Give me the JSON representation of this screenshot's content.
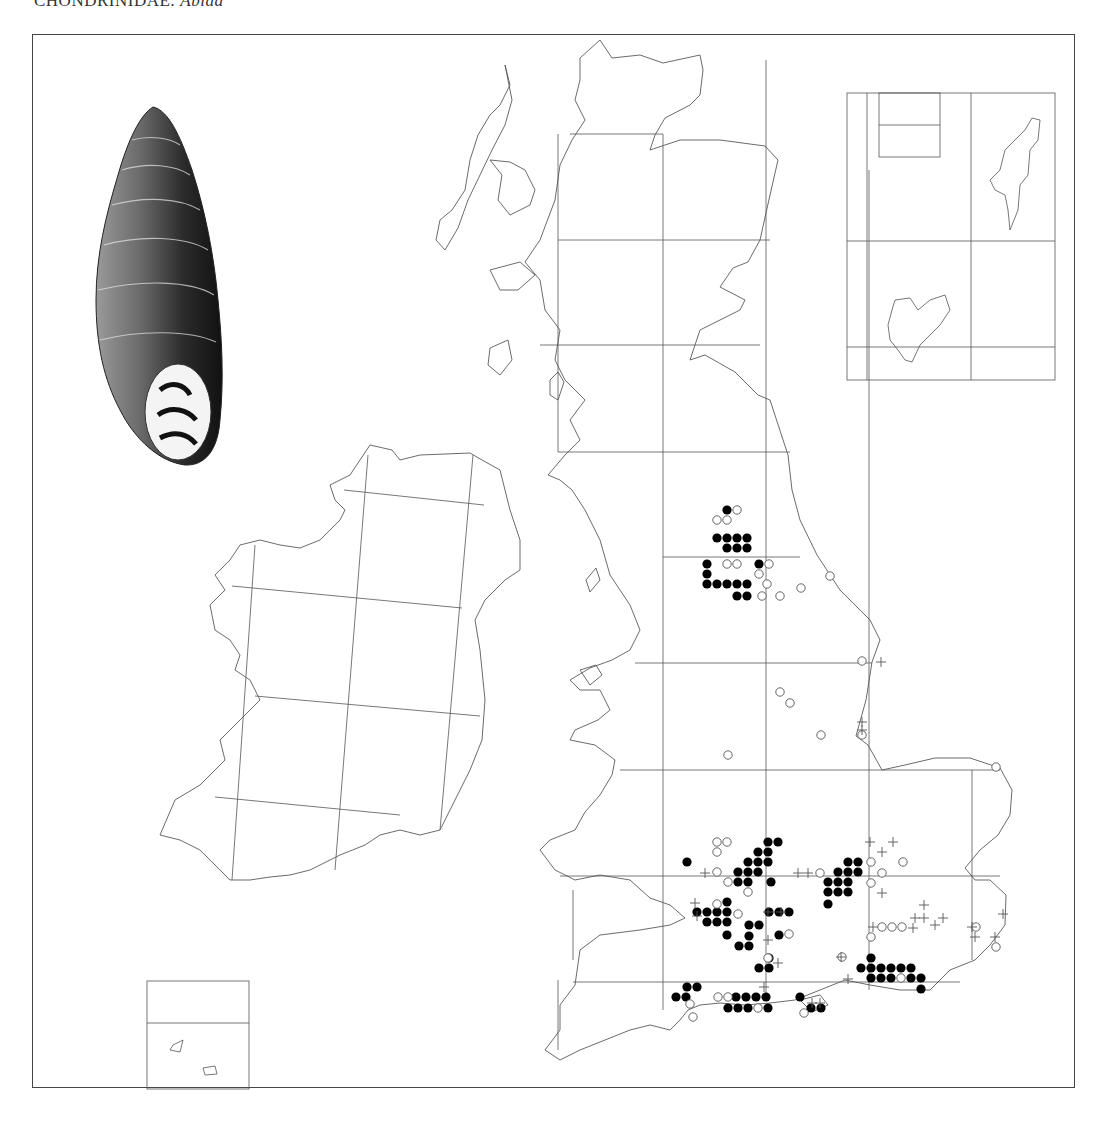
{
  "header": {
    "family": "CHONDRINIDAE:",
    "genus": "Abida"
  },
  "map": {
    "title": "Distribution map of Abida in Britain and Ireland",
    "grid_color": "#555555",
    "coast_color": "#555555",
    "dot_color": "#000000",
    "legend_symbols": {
      "filled_circle": "record (recent)",
      "open_circle": "record (older)",
      "plus": "record (fossil/subfossil)"
    },
    "filled": [
      [
        727,
        510
      ],
      [
        717,
        538
      ],
      [
        727,
        538
      ],
      [
        737,
        538
      ],
      [
        747,
        538
      ],
      [
        727,
        548
      ],
      [
        737,
        548
      ],
      [
        747,
        548
      ],
      [
        707,
        564
      ],
      [
        759,
        564
      ],
      [
        707,
        574
      ],
      [
        707,
        584
      ],
      [
        717,
        584
      ],
      [
        727,
        584
      ],
      [
        737,
        584
      ],
      [
        747,
        584
      ],
      [
        737,
        596
      ],
      [
        747,
        596
      ],
      [
        768,
        842
      ],
      [
        778,
        842
      ],
      [
        758,
        852
      ],
      [
        768,
        852
      ],
      [
        748,
        862
      ],
      [
        758,
        862
      ],
      [
        768,
        862
      ],
      [
        687,
        862
      ],
      [
        738,
        872
      ],
      [
        748,
        872
      ],
      [
        758,
        872
      ],
      [
        738,
        882
      ],
      [
        748,
        882
      ],
      [
        771,
        882
      ],
      [
        848,
        862
      ],
      [
        858,
        862
      ],
      [
        838,
        872
      ],
      [
        848,
        872
      ],
      [
        858,
        872
      ],
      [
        828,
        882
      ],
      [
        838,
        882
      ],
      [
        848,
        882
      ],
      [
        828,
        892
      ],
      [
        838,
        892
      ],
      [
        848,
        892
      ],
      [
        828,
        904
      ],
      [
        727,
        902
      ],
      [
        697,
        912
      ],
      [
        707,
        912
      ],
      [
        717,
        912
      ],
      [
        727,
        912
      ],
      [
        707,
        922
      ],
      [
        717,
        922
      ],
      [
        727,
        922
      ],
      [
        727,
        935
      ],
      [
        749,
        925
      ],
      [
        759,
        925
      ],
      [
        749,
        936
      ],
      [
        739,
        946
      ],
      [
        749,
        946
      ],
      [
        769,
        912
      ],
      [
        779,
        912
      ],
      [
        789,
        912
      ],
      [
        779,
        935
      ],
      [
        769,
        958
      ],
      [
        759,
        968
      ],
      [
        769,
        968
      ],
      [
        871,
        958
      ],
      [
        861,
        968
      ],
      [
        871,
        968
      ],
      [
        881,
        968
      ],
      [
        891,
        968
      ],
      [
        901,
        968
      ],
      [
        911,
        968
      ],
      [
        871,
        978
      ],
      [
        881,
        978
      ],
      [
        891,
        978
      ],
      [
        911,
        978
      ],
      [
        921,
        978
      ],
      [
        921,
        989
      ],
      [
        687,
        987
      ],
      [
        697,
        987
      ],
      [
        676,
        997
      ],
      [
        686,
        997
      ],
      [
        736,
        997
      ],
      [
        746,
        997
      ],
      [
        756,
        997
      ],
      [
        766,
        997
      ],
      [
        728,
        1008
      ],
      [
        738,
        1008
      ],
      [
        748,
        1008
      ],
      [
        768,
        1008
      ],
      [
        800,
        997
      ],
      [
        811,
        1008
      ],
      [
        821,
        1008
      ]
    ],
    "open": [
      [
        737,
        510
      ],
      [
        717,
        520
      ],
      [
        727,
        520
      ],
      [
        727,
        564
      ],
      [
        737,
        564
      ],
      [
        769,
        564
      ],
      [
        759,
        574
      ],
      [
        767,
        584
      ],
      [
        801,
        588
      ],
      [
        830,
        576
      ],
      [
        780,
        596
      ],
      [
        762,
        596
      ],
      [
        862,
        661
      ],
      [
        780,
        692
      ],
      [
        790,
        703
      ],
      [
        821,
        735
      ],
      [
        862,
        735
      ],
      [
        728,
        755
      ],
      [
        996,
        767
      ],
      [
        717,
        842
      ],
      [
        727,
        842
      ],
      [
        717,
        852
      ],
      [
        717,
        872
      ],
      [
        728,
        882
      ],
      [
        748,
        892
      ],
      [
        717,
        904
      ],
      [
        738,
        914
      ],
      [
        789,
        934
      ],
      [
        768,
        958
      ],
      [
        871,
        862
      ],
      [
        903,
        862
      ],
      [
        882,
        873
      ],
      [
        871,
        883
      ],
      [
        820,
        873
      ],
      [
        882,
        927
      ],
      [
        892,
        927
      ],
      [
        902,
        927
      ],
      [
        871,
        937
      ],
      [
        842,
        957
      ],
      [
        901,
        978
      ],
      [
        976,
        927
      ],
      [
        996,
        947
      ],
      [
        690,
        1004
      ],
      [
        718,
        997
      ],
      [
        728,
        997
      ],
      [
        758,
        1008
      ],
      [
        693,
        1017
      ],
      [
        804,
        1013
      ]
    ],
    "plus": [
      [
        870,
        842
      ],
      [
        893,
        842
      ],
      [
        882,
        852
      ],
      [
        882,
        893
      ],
      [
        924,
        905
      ],
      [
        915,
        918
      ],
      [
        924,
        918
      ],
      [
        913,
        928
      ],
      [
        943,
        918
      ],
      [
        935,
        925
      ],
      [
        972,
        927
      ],
      [
        975,
        937
      ],
      [
        995,
        937
      ],
      [
        873,
        927
      ],
      [
        841,
        957
      ],
      [
        848,
        979
      ],
      [
        881,
        662
      ],
      [
        862,
        722
      ],
      [
        862,
        730
      ],
      [
        768,
        912
      ],
      [
        781,
        912
      ],
      [
        768,
        940
      ],
      [
        778,
        963
      ],
      [
        798,
        873
      ],
      [
        808,
        873
      ],
      [
        764,
        987
      ],
      [
        812,
        1003
      ],
      [
        820,
        1003
      ],
      [
        1003,
        914
      ],
      [
        695,
        903
      ],
      [
        705,
        873
      ],
      [
        697,
        916
      ]
    ]
  }
}
